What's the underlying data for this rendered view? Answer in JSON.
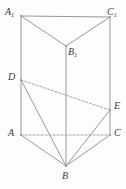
{
  "figure": {
    "kind": "geometry-diagram",
    "canvas": {
      "width": 126,
      "height": 189
    },
    "style": {
      "line_color": "#8c8c8c",
      "dashed_color": "#9a9a9a",
      "label_color": "#3a3a3a",
      "background": "#fdfdfd",
      "stroke_width": 0.9,
      "dash_pattern": "2.2 1.8"
    },
    "vertices": [
      {
        "id": "A1",
        "label": "A",
        "sub": "1",
        "x": 21,
        "y": 16,
        "label_x": 5,
        "label_y": 7
      },
      {
        "id": "C1",
        "label": "C",
        "sub": "1",
        "x": 110,
        "y": 17,
        "label_x": 107,
        "label_y": 7
      },
      {
        "id": "B1",
        "label": "B",
        "sub": "1",
        "x": 66,
        "y": 46,
        "label_x": 68,
        "label_y": 47
      },
      {
        "id": "D",
        "label": "D",
        "sub": "",
        "x": 21,
        "y": 80,
        "label_x": 8,
        "label_y": 72
      },
      {
        "id": "E",
        "label": "E",
        "sub": "",
        "x": 110,
        "y": 110,
        "label_x": 114,
        "label_y": 101
      },
      {
        "id": "A",
        "label": "A",
        "sub": "",
        "x": 21,
        "y": 135,
        "label_x": 8,
        "label_y": 128
      },
      {
        "id": "C",
        "label": "C",
        "sub": "",
        "x": 110,
        "y": 135,
        "label_x": 114,
        "label_y": 128
      },
      {
        "id": "B",
        "label": "B",
        "sub": "",
        "x": 66,
        "y": 166,
        "label_x": 62,
        "label_y": 171
      }
    ],
    "edges_solid": [
      {
        "name": "edge-A1-C1",
        "x1": 21,
        "y1": 16,
        "x2": 110,
        "y2": 17
      },
      {
        "name": "edge-A1-B1",
        "x1": 21,
        "y1": 16,
        "x2": 66,
        "y2": 46
      },
      {
        "name": "edge-C1-B1",
        "x1": 110,
        "y1": 17,
        "x2": 66,
        "y2": 46
      },
      {
        "name": "edge-A1-A",
        "x1": 21,
        "y1": 16,
        "x2": 21,
        "y2": 135
      },
      {
        "name": "edge-C1-C",
        "x1": 110,
        "y1": 17,
        "x2": 110,
        "y2": 135
      },
      {
        "name": "edge-B1-B",
        "x1": 66,
        "y1": 46,
        "x2": 66,
        "y2": 166
      },
      {
        "name": "edge-A-B",
        "x1": 21,
        "y1": 135,
        "x2": 66,
        "y2": 166
      },
      {
        "name": "edge-C-B",
        "x1": 110,
        "y1": 135,
        "x2": 66,
        "y2": 166
      },
      {
        "name": "segment-D-B",
        "x1": 21,
        "y1": 80,
        "x2": 66,
        "y2": 166
      },
      {
        "name": "segment-E-B",
        "x1": 110,
        "y1": 110,
        "x2": 66,
        "y2": 166
      }
    ],
    "edges_dashed": [
      {
        "name": "segment-D-E",
        "x1": 21,
        "y1": 80,
        "x2": 110,
        "y2": 110
      },
      {
        "name": "edge-A-C",
        "x1": 21,
        "y1": 135,
        "x2": 110,
        "y2": 135
      }
    ]
  }
}
